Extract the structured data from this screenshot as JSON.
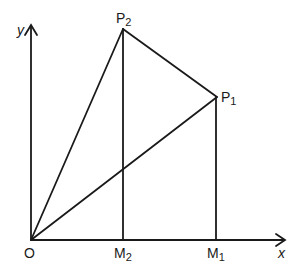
{
  "diagram": {
    "axes": {
      "x_label": "x",
      "y_label": "y"
    },
    "points": {
      "origin": {
        "label": "O",
        "x": 31,
        "y": 240
      },
      "P1": {
        "label": "P",
        "sub": "1",
        "x": 217,
        "y": 97
      },
      "P2": {
        "label": "P",
        "sub": "2",
        "x": 123,
        "y": 29
      },
      "M1": {
        "label": "M",
        "sub": "1",
        "x": 216,
        "y": 240
      },
      "M2": {
        "label": "M",
        "sub": "2",
        "x": 123,
        "y": 240
      }
    },
    "segments": [
      {
        "from": "O",
        "to": "P2"
      },
      {
        "from": "O",
        "to": "P1"
      },
      {
        "from": "P2",
        "to": "P1"
      },
      {
        "from": "P2",
        "to": "M2"
      },
      {
        "from": "P1",
        "to": "M1"
      }
    ],
    "stroke_color": "#1a1a1a",
    "background": "#ffffff"
  }
}
